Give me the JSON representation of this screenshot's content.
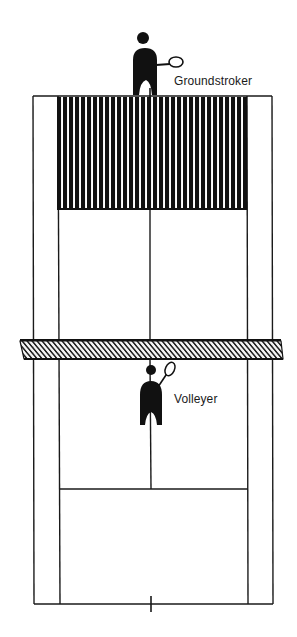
{
  "diagram": {
    "labels": {
      "groundstroker": "Groundstroker",
      "volleyer": "Volleyer"
    },
    "colors": {
      "line": "#1a1a1a",
      "fill": "#111111",
      "background": "#ffffff"
    },
    "court": {
      "outer_left_x": 33,
      "outer_right_x": 272,
      "inner_left_x": 58,
      "inner_right_x": 247,
      "center_x": 150,
      "top_baseline_y": 96,
      "bottom_baseline_y": 604,
      "top_service_line_y": 209,
      "bottom_service_line_y": 489,
      "net_top_y": 340,
      "net_bottom_y": 359
    },
    "shaded_zone": {
      "description": "Target area behind far service line (groundstroker's deep court)",
      "x": 57,
      "y": 97,
      "width": 190,
      "height": 112
    },
    "players": [
      {
        "role": "groundstroker",
        "position": "far baseline"
      },
      {
        "role": "volleyer",
        "position": "near net"
      }
    ]
  }
}
